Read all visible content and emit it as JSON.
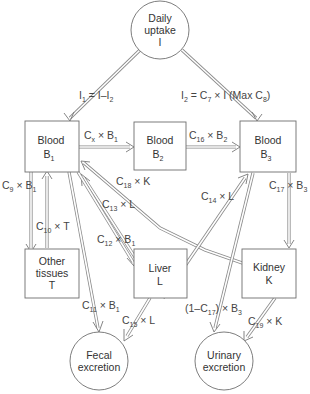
{
  "diagram": {
    "type": "compartment-flow-model",
    "nodes": {
      "intake": {
        "line1": "Daily",
        "line2": "uptake",
        "line3": "I"
      },
      "blood1": {
        "line1": "Blood",
        "sym": "B",
        "sub": "1"
      },
      "blood2": {
        "line1": "Blood",
        "sym": "B",
        "sub": "2"
      },
      "blood3": {
        "line1": "Blood",
        "sym": "B",
        "sub": "3"
      },
      "tissues": {
        "line1": "Other",
        "line2": "tissues",
        "line3": "T"
      },
      "liver": {
        "line1": "Liver",
        "line2": "L"
      },
      "kidney": {
        "line1": "Kidney",
        "line2": "K"
      },
      "fecal": {
        "line1": "Fecal",
        "line2": "excretion"
      },
      "urinary": {
        "line1": "Urinary",
        "line2": "excretion"
      }
    },
    "edges": [
      {
        "from": "intake",
        "to": "blood1",
        "label": "I1 = I–I2"
      },
      {
        "from": "intake",
        "to": "blood3",
        "label": "I2 = C7 × I (Max C8)"
      },
      {
        "from": "blood1",
        "to": "blood2",
        "label": "Cx × B1"
      },
      {
        "from": "blood2",
        "to": "blood3",
        "label": "C16 × B2"
      },
      {
        "from": "blood1",
        "to": "tissues",
        "label": "C9 × B1"
      },
      {
        "from": "tissues",
        "to": "blood1",
        "label": "C10 × T"
      },
      {
        "from": "kidney",
        "to": "blood1",
        "label": "C18 × K"
      },
      {
        "from": "liver",
        "to": "blood1",
        "label": "C13 × L"
      },
      {
        "from": "blood1",
        "to": "liver",
        "label": "C12 × B1"
      },
      {
        "from": "liver",
        "to": "blood3",
        "label": "C14 × L"
      },
      {
        "from": "blood3",
        "to": "kidney",
        "label": "C17 × B3"
      },
      {
        "from": "blood1",
        "to": "fecal",
        "label": "C11 × B1"
      },
      {
        "from": "liver",
        "to": "fecal",
        "label": "C15 × L"
      },
      {
        "from": "blood3",
        "to": "urinary",
        "label": "(1–C17) × B3"
      },
      {
        "from": "kidney",
        "to": "urinary",
        "label": "C19 × K"
      }
    ]
  },
  "labels": {
    "i1": {
      "a": "I",
      "as": "1",
      "b": " = I–I",
      "bs": "2"
    },
    "i2": {
      "a": "I",
      "as": "2",
      "b": " = C",
      "bs": "7",
      "c": " × I (Max C",
      "cs": "8",
      "d": ")"
    },
    "cx": {
      "a": "C",
      "as": "x",
      "b": " × B",
      "bs": "1"
    },
    "c16": {
      "a": "C",
      "as": "16",
      "b": " × B",
      "bs": "2"
    },
    "c9": {
      "a": "C",
      "as": "9",
      "b": " × B",
      "bs": "1"
    },
    "c10": {
      "a": "C",
      "as": "10",
      "b": " × T"
    },
    "c18": {
      "a": "C",
      "as": "18",
      "b": " × K"
    },
    "c13": {
      "a": "C",
      "as": "13",
      "b": " × L"
    },
    "c12": {
      "a": "C",
      "as": "12",
      "b": " × B",
      "bs": "1"
    },
    "c14": {
      "a": "C",
      "as": "14",
      "b": " × L"
    },
    "c17": {
      "a": "C",
      "as": "17",
      "b": " × B",
      "bs": "3"
    },
    "c11": {
      "a": "C",
      "as": "11",
      "b": " × B",
      "bs": "1"
    },
    "c15": {
      "a": "C",
      "as": "15",
      "b": " × L"
    },
    "c17b": {
      "a": "(1–C",
      "as": "17",
      "b": ") × B",
      "bs": "3"
    },
    "c19": {
      "a": "C",
      "as": "19",
      "b": " × K"
    }
  }
}
